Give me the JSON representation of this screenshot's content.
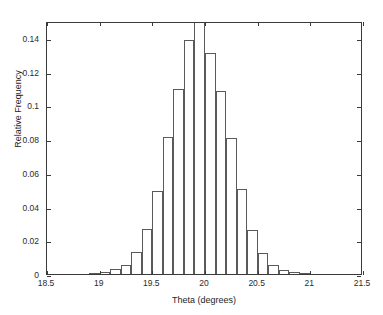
{
  "chart_data": {
    "type": "bar",
    "subtype": "histogram",
    "title": "",
    "xlabel": "Theta (degrees)",
    "ylabel": "Relative Frequency",
    "xlim": [
      18.5,
      21.5
    ],
    "ylim": [
      0,
      0.15
    ],
    "grid": false,
    "legend": false,
    "bin_width": 0.1,
    "xticks": [
      18.5,
      19,
      19.5,
      20,
      20.5,
      21,
      21.5
    ],
    "xticklabels": [
      "18.5",
      "19",
      "19.5",
      "20",
      "20.5",
      "21",
      "21.5"
    ],
    "yticks": [
      0,
      0.02,
      0.04,
      0.06,
      0.08,
      0.1,
      0.12,
      0.14
    ],
    "yticklabels": [
      "0",
      "0.02",
      "0.04",
      "0.06",
      "0.08",
      "0.1",
      "0.12",
      "0.14"
    ],
    "bar_edge_color": "#5a5a5a",
    "bar_fill_color": "none",
    "axis_color": "#3a3a3a",
    "categories": [
      "18.95",
      "19.05",
      "19.15",
      "19.25",
      "19.35",
      "19.45",
      "19.55",
      "19.65",
      "19.75",
      "19.85",
      "19.95",
      "20.05",
      "20.15",
      "20.25",
      "20.35",
      "20.45",
      "20.55",
      "20.65",
      "20.75",
      "20.85",
      "20.95"
    ],
    "bin_centers": [
      18.95,
      19.05,
      19.15,
      19.25,
      19.35,
      19.45,
      19.55,
      19.65,
      19.75,
      19.85,
      19.95,
      20.05,
      20.15,
      20.25,
      20.35,
      20.45,
      20.55,
      20.65,
      20.75,
      20.85,
      20.95
    ],
    "values": [
      0.0005,
      0.001,
      0.003,
      0.0055,
      0.0132,
      0.0265,
      0.049,
      0.081,
      0.1095,
      0.139,
      0.15,
      0.1312,
      0.1088,
      0.0808,
      0.0505,
      0.0262,
      0.0122,
      0.0055,
      0.0022,
      0.001,
      0.0003
    ]
  },
  "figure": {
    "background": "#ffffff",
    "axis_line_color": "#3a3a3a"
  }
}
